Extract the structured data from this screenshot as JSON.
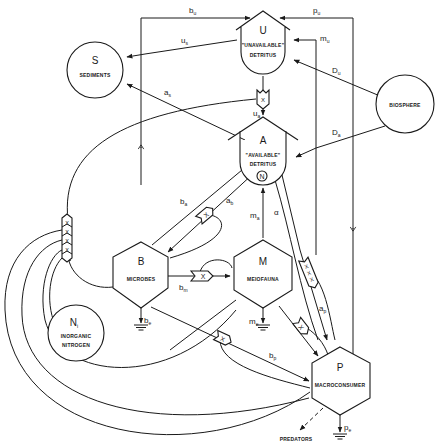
{
  "diagram": {
    "type": "compartment flow diagram (nitrogen / detritus ecosystem model)",
    "nodes": {
      "U": {
        "symbol": "U",
        "label1": "\"UNAVAILABLE\"",
        "label2": "DETRITUS",
        "shape": "storage-tank"
      },
      "A": {
        "symbol": "A",
        "label1": "\"AVAILABLE\"",
        "label2": "DETRITUS",
        "shape": "storage-tank",
        "marker": "N"
      },
      "S": {
        "symbol": "S",
        "label": "SEDIMENTS",
        "shape": "circle"
      },
      "BIO": {
        "label": "BIOSPHERE",
        "shape": "circle"
      },
      "B": {
        "symbol": "B",
        "label": "MICROBES",
        "shape": "hexagon"
      },
      "M": {
        "symbol": "M",
        "label": "MEIOFAUNA",
        "shape": "hexagon"
      },
      "P": {
        "symbol": "P",
        "label": "MACROCONSUMER",
        "shape": "hexagon"
      },
      "N": {
        "symbol": "N",
        "subscript": "i",
        "label1": "INORGANIC",
        "label2": "NITROGEN",
        "shape": "circle"
      },
      "PRED": {
        "label": "PREDATORS"
      }
    },
    "flows": {
      "bu": {
        "base": "b",
        "sub": "u"
      },
      "pu": {
        "base": "p",
        "sub": "u"
      },
      "us": {
        "base": "u",
        "sub": "s"
      },
      "mu": {
        "base": "m",
        "sub": "u"
      },
      "Du": {
        "base": "D",
        "sub": "u"
      },
      "as": {
        "base": "a",
        "sub": "s"
      },
      "ua": {
        "base": "u",
        "sub": "a"
      },
      "Da": {
        "base": "D",
        "sub": "a"
      },
      "ba": {
        "base": "b",
        "sub": "a"
      },
      "ab": {
        "base": "a",
        "sub": "b"
      },
      "ma": {
        "base": "m",
        "sub": "a"
      },
      "alpha": {
        "base": "α",
        "sub": ""
      },
      "bm": {
        "base": "b",
        "sub": "m"
      },
      "ap": {
        "base": "a",
        "sub": "p"
      },
      "be": {
        "base": "b",
        "sub": "e"
      },
      "me": {
        "base": "m",
        "sub": "e"
      },
      "bp": {
        "base": "b",
        "sub": "p"
      },
      "pe": {
        "base": "p",
        "sub": "e"
      }
    },
    "multiplier_symbol": "X"
  }
}
